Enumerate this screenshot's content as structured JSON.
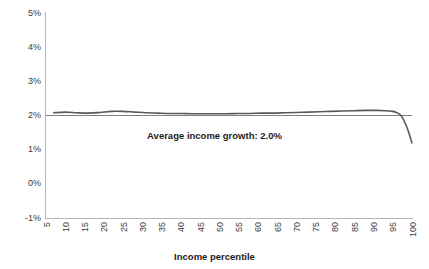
{
  "chart_data": {
    "type": "line",
    "title": "",
    "xlabel": "Income percentile",
    "ylabel": "",
    "xlim": [
      5,
      100
    ],
    "ylim": [
      -1,
      5
    ],
    "grid": false,
    "legend": null,
    "annotations": [
      {
        "name": "average-income-growth",
        "text": "Average income growth: 2.0%",
        "value": 2.0
      }
    ],
    "ytick_labels": [
      "5%",
      "4%",
      "3%",
      "2%",
      "1%",
      "0%",
      "-1%"
    ],
    "ytick_values": [
      5,
      4,
      3,
      2,
      1,
      0,
      -1
    ],
    "xtick_labels": [
      "5",
      "10",
      "15",
      "20",
      "25",
      "30",
      "35",
      "40",
      "45",
      "50",
      "55",
      "60",
      "65",
      "70",
      "75",
      "80",
      "85",
      "90",
      "95",
      "100"
    ],
    "xtick_values": [
      5,
      10,
      15,
      20,
      25,
      30,
      35,
      40,
      45,
      50,
      55,
      60,
      65,
      70,
      75,
      80,
      85,
      90,
      95,
      100
    ],
    "series": [
      {
        "name": "Income growth by percentile",
        "color": "#595959",
        "x": [
          7,
          10,
          13,
          16,
          19,
          22,
          25,
          28,
          31,
          34,
          37,
          40,
          43,
          46,
          49,
          52,
          55,
          58,
          61,
          64,
          67,
          70,
          73,
          76,
          79,
          82,
          85,
          88,
          91,
          93,
          95,
          96,
          97,
          97.6,
          98.2,
          98.8,
          99.3,
          99.7,
          100
        ],
        "values": [
          2.08,
          2.1,
          2.08,
          2.07,
          2.09,
          2.12,
          2.12,
          2.1,
          2.08,
          2.07,
          2.06,
          2.06,
          2.05,
          2.05,
          2.05,
          2.05,
          2.06,
          2.06,
          2.07,
          2.07,
          2.08,
          2.09,
          2.1,
          2.11,
          2.12,
          2.13,
          2.14,
          2.15,
          2.15,
          2.14,
          2.12,
          2.09,
          2.02,
          1.92,
          1.78,
          1.62,
          1.45,
          1.3,
          1.2
        ]
      },
      {
        "name": "Average reference line",
        "color": "#7f7f7f",
        "x": [
          5,
          100
        ],
        "values": [
          2.0,
          2.0
        ]
      }
    ]
  },
  "axis": {
    "color": "#b6b6b6"
  }
}
